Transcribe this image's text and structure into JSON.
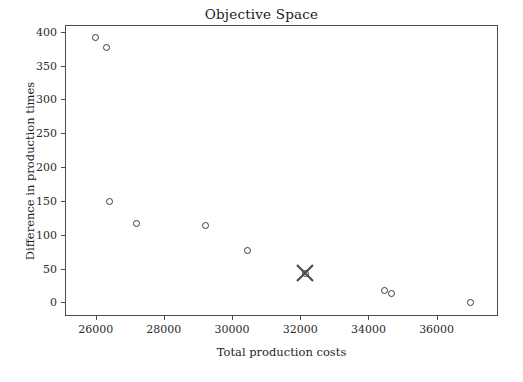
{
  "chart_data": {
    "type": "scatter",
    "title": "Objective Space",
    "xlabel": "Total production costs",
    "ylabel": "Difference in production times",
    "xlim": [
      25100,
      37800
    ],
    "ylim": [
      -20,
      410
    ],
    "xticks": [
      26000,
      28000,
      30000,
      32000,
      34000,
      36000
    ],
    "xticklabels": [
      "26000",
      "28000",
      "30000",
      "32000",
      "34000",
      "36000"
    ],
    "yticks": [
      0,
      50,
      100,
      150,
      200,
      250,
      300,
      350,
      400
    ],
    "yticklabels": [
      "0",
      "50",
      "100",
      "150",
      "200",
      "250",
      "300",
      "350",
      "400"
    ],
    "grid": false,
    "legend": null,
    "marker": "circle-open",
    "marker_color": "#3a3a3a",
    "highlight_marker": "x-cross",
    "highlight_color": "#4a4a4a",
    "points": [
      {
        "x": 25970,
        "y": 393,
        "highlight": false
      },
      {
        "x": 26290,
        "y": 378,
        "highlight": false
      },
      {
        "x": 26370,
        "y": 151,
        "highlight": false
      },
      {
        "x": 27180,
        "y": 118,
        "highlight": false
      },
      {
        "x": 29200,
        "y": 115,
        "highlight": false
      },
      {
        "x": 30430,
        "y": 79,
        "highlight": false
      },
      {
        "x": 32120,
        "y": 45,
        "highlight": true
      },
      {
        "x": 34450,
        "y": 19,
        "highlight": false
      },
      {
        "x": 34660,
        "y": 15,
        "highlight": false
      },
      {
        "x": 36960,
        "y": 2,
        "highlight": false
      }
    ]
  }
}
